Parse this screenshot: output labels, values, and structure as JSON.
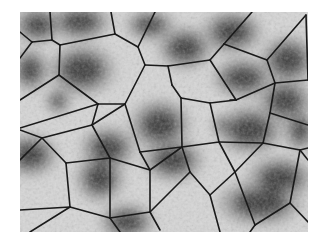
{
  "image": {
    "description": "Grayscale micrograph of cell nuclei overlaid with a Voronoi tessellation",
    "background": "#ffffff",
    "frame": {
      "x": 20,
      "y": 12,
      "width": 288,
      "height": 220
    },
    "colors": {
      "edge": "#1a1a1a",
      "tissue_light": "#d6d6d6",
      "tissue_mid": "#a8a8a8",
      "nucleus_dark": "#3a3a3a"
    }
  },
  "nuclei": [
    {
      "x": 38,
      "y": 25,
      "rx": 16,
      "ry": 12
    },
    {
      "x": 80,
      "y": 22,
      "rx": 20,
      "ry": 12
    },
    {
      "x": 30,
      "y": 70,
      "rx": 12,
      "ry": 14
    },
    {
      "x": 82,
      "y": 70,
      "rx": 22,
      "ry": 17
    },
    {
      "x": 150,
      "y": 25,
      "rx": 16,
      "ry": 10
    },
    {
      "x": 185,
      "y": 48,
      "rx": 18,
      "ry": 14
    },
    {
      "x": 232,
      "y": 32,
      "rx": 20,
      "ry": 14
    },
    {
      "x": 288,
      "y": 60,
      "rx": 18,
      "ry": 16
    },
    {
      "x": 58,
      "y": 101,
      "rx": 8,
      "ry": 8
    },
    {
      "x": 160,
      "y": 125,
      "rx": 20,
      "ry": 17
    },
    {
      "x": 243,
      "y": 78,
      "rx": 20,
      "ry": 13
    },
    {
      "x": 285,
      "y": 101,
      "rx": 18,
      "ry": 15
    },
    {
      "x": 250,
      "y": 130,
      "rx": 22,
      "ry": 16
    },
    {
      "x": 30,
      "y": 155,
      "rx": 18,
      "ry": 14
    },
    {
      "x": 108,
      "y": 148,
      "rx": 18,
      "ry": 14
    },
    {
      "x": 100,
      "y": 178,
      "rx": 16,
      "ry": 16
    },
    {
      "x": 173,
      "y": 160,
      "rx": 20,
      "ry": 14
    },
    {
      "x": 222,
      "y": 125,
      "rx": 6,
      "ry": 6
    },
    {
      "x": 127,
      "y": 222,
      "rx": 18,
      "ry": 12
    },
    {
      "x": 280,
      "y": 178,
      "rx": 22,
      "ry": 14
    },
    {
      "x": 260,
      "y": 203,
      "rx": 28,
      "ry": 15
    },
    {
      "x": 300,
      "y": 130,
      "rx": 10,
      "ry": 14
    }
  ],
  "edges": [
    [
      50,
      12,
      52,
      40
    ],
    [
      20,
      32,
      32,
      42
    ],
    [
      32,
      42,
      20,
      58
    ],
    [
      32,
      42,
      52,
      40
    ],
    [
      52,
      40,
      60,
      45
    ],
    [
      60,
      45,
      115,
      34
    ],
    [
      60,
      45,
      59,
      75
    ],
    [
      59,
      75,
      20,
      100
    ],
    [
      59,
      75,
      98,
      104
    ],
    [
      111,
      12,
      115,
      34
    ],
    [
      115,
      34,
      138,
      47
    ],
    [
      155,
      12,
      138,
      47
    ],
    [
      138,
      47,
      145,
      65
    ],
    [
      145,
      65,
      168,
      66
    ],
    [
      168,
      66,
      210,
      60
    ],
    [
      168,
      66,
      172,
      85
    ],
    [
      98,
      104,
      125,
      104
    ],
    [
      125,
      104,
      145,
      65
    ],
    [
      98,
      104,
      20,
      128
    ],
    [
      210,
      60,
      224,
      44
    ],
    [
      252,
      12,
      224,
      44
    ],
    [
      224,
      44,
      267,
      60
    ],
    [
      267,
      60,
      306,
      15
    ],
    [
      306,
      15,
      308,
      80
    ],
    [
      267,
      60,
      275,
      83
    ],
    [
      275,
      83,
      308,
      80
    ],
    [
      210,
      60,
      236,
      100
    ],
    [
      236,
      100,
      275,
      83
    ],
    [
      125,
      104,
      140,
      152
    ],
    [
      172,
      85,
      181,
      98
    ],
    [
      181,
      98,
      210,
      103
    ],
    [
      210,
      103,
      236,
      100
    ],
    [
      181,
      98,
      182,
      147
    ],
    [
      140,
      152,
      182,
      147
    ],
    [
      210,
      103,
      219,
      142
    ],
    [
      219,
      142,
      182,
      147
    ],
    [
      236,
      100,
      230,
      100
    ],
    [
      270,
      113,
      275,
      83
    ],
    [
      270,
      113,
      308,
      125
    ],
    [
      263,
      143,
      270,
      113
    ],
    [
      219,
      142,
      263,
      143
    ],
    [
      263,
      143,
      300,
      150
    ],
    [
      300,
      150,
      308,
      148
    ],
    [
      20,
      130,
      42,
      138
    ],
    [
      42,
      138,
      20,
      160
    ],
    [
      42,
      138,
      92,
      125
    ],
    [
      92,
      125,
      98,
      104
    ],
    [
      92,
      125,
      125,
      104
    ],
    [
      92,
      125,
      110,
      158
    ],
    [
      110,
      158,
      150,
      170
    ],
    [
      150,
      170,
      140,
      152
    ],
    [
      110,
      158,
      66,
      163
    ],
    [
      66,
      163,
      42,
      138
    ],
    [
      66,
      163,
      70,
      207
    ],
    [
      70,
      207,
      20,
      210
    ],
    [
      70,
      207,
      30,
      232
    ],
    [
      70,
      207,
      110,
      218
    ],
    [
      110,
      218,
      110,
      158
    ],
    [
      110,
      218,
      120,
      232
    ],
    [
      110,
      218,
      150,
      212
    ],
    [
      150,
      212,
      160,
      230
    ],
    [
      150,
      212,
      150,
      170
    ],
    [
      150,
      170,
      182,
      147
    ],
    [
      182,
      147,
      190,
      172
    ],
    [
      190,
      172,
      150,
      212
    ],
    [
      190,
      172,
      210,
      195
    ],
    [
      210,
      195,
      220,
      232
    ],
    [
      210,
      195,
      235,
      172
    ],
    [
      235,
      172,
      219,
      142
    ],
    [
      235,
      172,
      263,
      143
    ],
    [
      235,
      172,
      255,
      225
    ],
    [
      255,
      225,
      250,
      232
    ],
    [
      255,
      225,
      290,
      203
    ],
    [
      290,
      203,
      300,
      150
    ],
    [
      290,
      203,
      308,
      222
    ],
    [
      300,
      150,
      308,
      160
    ]
  ]
}
